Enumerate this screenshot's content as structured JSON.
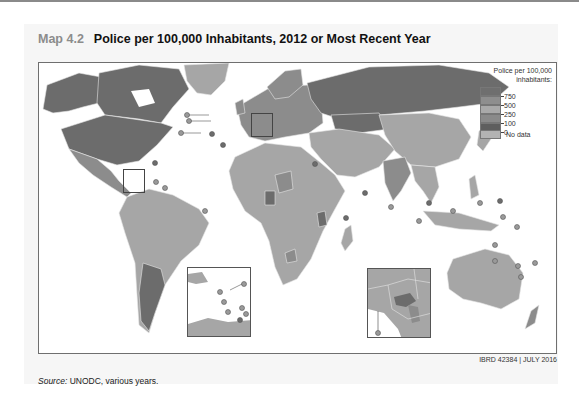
{
  "header": {
    "map_number": "Map 4.2",
    "title": "Police per 100,000 Inhabitants, 2012 or Most Recent Year"
  },
  "legend": {
    "title": "Police per 100,000 inhabitants:",
    "bins": [
      {
        "label": "750",
        "color": "#6f6f6f"
      },
      {
        "label": "500",
        "color": "#8e8e8e"
      },
      {
        "label": "250",
        "color": "#a9a9a9"
      },
      {
        "label": "100",
        "color": "#8a8a8a"
      },
      {
        "label": "0",
        "color": "#5e5e5e"
      }
    ],
    "no_data_label": "No data",
    "no_data_color": "#b3b3b3"
  },
  "insets": [
    {
      "name": "Caribbean",
      "region": "Lesser Antilles"
    },
    {
      "name": "Central Europe",
      "region": "Balkans / Hungary"
    }
  ],
  "credit": "IBRD 42384 | JULY 2016",
  "source": {
    "label": "Source:",
    "text": " UNODC, various years."
  },
  "colors": {
    "ocean": "#ffffff",
    "land_default": "#a6a6a6",
    "land_dark": "#6c6c6c",
    "land_mid": "#8c8c8c",
    "border": "#e6e6e6",
    "frame": "#6f6f6f"
  }
}
